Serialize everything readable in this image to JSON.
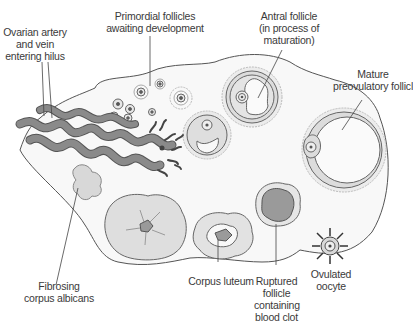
{
  "diagram": {
    "labels": {
      "ovarian_artery": [
        "Ovarian artery",
        "and vein",
        "entering hilus"
      ],
      "primordial": [
        "Primordial follicles",
        "awaiting development"
      ],
      "antral": [
        "Antral follicle",
        "(in process of",
        "maturation)"
      ],
      "mature": [
        "Mature",
        "preovulatory follicle"
      ],
      "corpus_albicans": [
        "Fibrosing",
        "corpus albicans"
      ],
      "corpus_luteum": [
        "Corpus luteum"
      ],
      "ruptured": [
        "Ruptured",
        "follicle",
        "containing",
        "blood clot"
      ],
      "oocyte": [
        "Ovulated",
        "oocyte"
      ]
    },
    "colors": {
      "outline": "#555555",
      "stroma": "#f7f7f7",
      "follicle_fill": "#e2e2e2",
      "vessel": "#8a8a8a",
      "blood_clot": "#9a9a9a",
      "text": "#3a3a3a"
    }
  }
}
